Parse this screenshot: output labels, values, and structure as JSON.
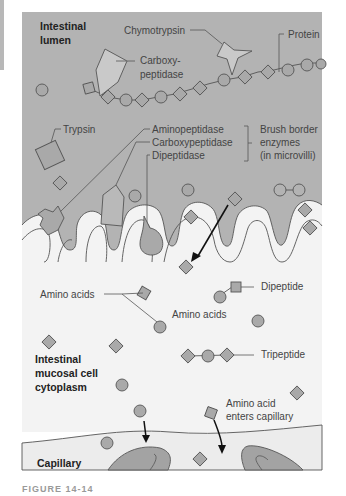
{
  "regions": {
    "lumen": "Intestinal lumen",
    "lumen_line1": "Intestinal",
    "lumen_line2": "lumen",
    "cytoplasm_line1": "Intestinal",
    "cytoplasm_line2": "mucosal cell",
    "cytoplasm_line3": "cytoplasm",
    "capillary": "Capillary"
  },
  "labels": {
    "chymotrypsin": "Chymotrypsin",
    "protein": "Protein",
    "carboxy_line1": "Carboxy-",
    "carboxy_line2": "peptidase",
    "trypsin": "Trypsin",
    "aminopeptidase": "Aminopeptidase",
    "carboxypeptidase": "Carboxypeptidase",
    "dipeptidase": "Dipeptidase",
    "brush_line1": "Brush border",
    "brush_line2": "enzymes",
    "brush_line3": "(in microvilli)",
    "amino_acids_left": "Amino acids",
    "amino_acids_center": "Amino acids",
    "dipeptide": "Dipeptide",
    "tripeptide": "Tripeptide",
    "enters_line1": "Amino acid",
    "enters_line2": "enters capillary"
  },
  "caption": "FIGURE 14-14",
  "colors": {
    "lumen_bg": "#b3b3b3",
    "cell_bg": "#f3f3f3",
    "shape_fill": "#a9a9a9",
    "enzyme_fill": "#c9c9c9",
    "stroke": "#555555",
    "capillary_fill": "#a3a3a3"
  }
}
